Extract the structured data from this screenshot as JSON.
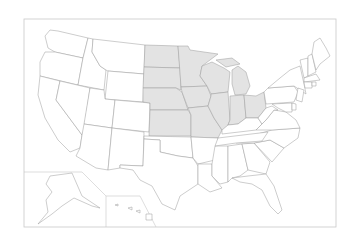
{
  "map": {
    "title": "United States — Midwest region highlighted",
    "highlighted_region": "Midwest",
    "colors": {
      "background": "#ffffff",
      "state_default": "#ffffff",
      "state_highlight": "#e3e3e3",
      "border": "#9a9a9a",
      "frame": "#c8c8c8"
    },
    "highlighted_states": [
      "ND",
      "SD",
      "NE",
      "KS",
      "MN",
      "IA",
      "MO",
      "WI",
      "IL",
      "MI",
      "IN",
      "OH"
    ],
    "insets": [
      "Alaska",
      "Hawaii"
    ]
  }
}
